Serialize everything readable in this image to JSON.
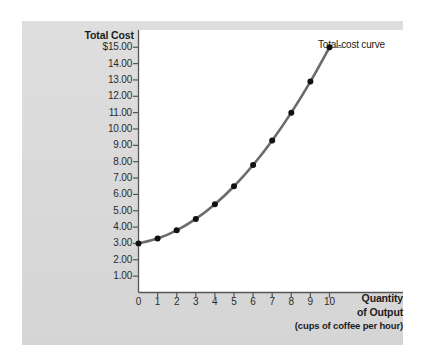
{
  "figure": {
    "name": "total-cost-curve-figure",
    "background_color": "#ffffff",
    "panel_color": "#dcdcdc",
    "plot_color": "#ffffff"
  },
  "chart_data": {
    "type": "line",
    "title": "",
    "ylabel": "Total Cost",
    "xlabel": "Quantity of Output",
    "xlabel_line1": "Quantity",
    "xlabel_line2": "of Output",
    "xlabel_sub": "(cups of coffee per hour)",
    "x": [
      0,
      1,
      2,
      3,
      4,
      5,
      6,
      7,
      8,
      9,
      10
    ],
    "values": [
      3.0,
      3.3,
      3.8,
      4.5,
      5.4,
      6.5,
      7.8,
      9.3,
      11.0,
      12.9,
      15.0
    ],
    "series": [
      {
        "name": "Total-cost curve",
        "values": [
          3.0,
          3.3,
          3.8,
          4.5,
          5.4,
          6.5,
          7.8,
          9.3,
          11.0,
          12.9,
          15.0
        ]
      }
    ],
    "xlim": [
      0,
      13.9
    ],
    "ylim": [
      0,
      15.9
    ],
    "xticks": [
      0,
      1,
      2,
      3,
      4,
      5,
      6,
      7,
      8,
      9,
      10
    ],
    "xtick_labels": [
      "0",
      "1",
      "2",
      "3",
      "4",
      "5",
      "6",
      "7",
      "8",
      "9",
      "10"
    ],
    "yticks": [
      1,
      2,
      3,
      4,
      5,
      6,
      7,
      8,
      9,
      10,
      11,
      12,
      13,
      14,
      15
    ],
    "ytick_labels": [
      "1.00",
      "2.00",
      "3.00",
      "4.00",
      "5.00",
      "6.00",
      "7.00",
      "8.00",
      "9.00",
      "10.00",
      "11.00",
      "12.00",
      "13.00",
      "14.00",
      "$15.00"
    ],
    "grid": false,
    "legend_position": "inline-annotation",
    "annotations": [
      {
        "text": "Total-cost curve",
        "x": 10,
        "y": 15.0
      }
    ],
    "line_color": "#6b6b6b",
    "marker_color": "#111111",
    "axis_color": "#555555"
  },
  "axes": {
    "y_title": "Total Cost",
    "x_title_line1": "Quantity",
    "x_title_line2": "of Output",
    "x_title_sub": "(cups of coffee per hour)"
  },
  "annotation": {
    "curve_label": "Total-cost curve"
  }
}
